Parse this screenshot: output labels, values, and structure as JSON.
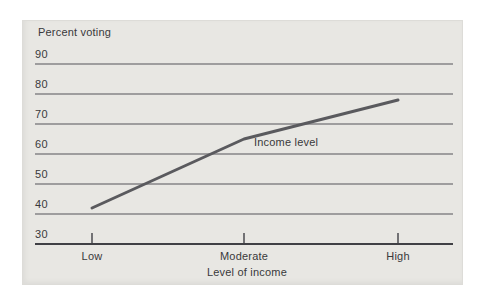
{
  "colors": {
    "panel_background": "#e8e7e3",
    "grid_line": "#55555a",
    "axis_line": "#404045",
    "data_line": "#5a5a5e",
    "text": "#39393b"
  },
  "chart_data": {
    "type": "line",
    "title": "",
    "ylabel": "Percent voting",
    "xlabel": "Level of income",
    "categories": [
      "Low",
      "Moderate",
      "High"
    ],
    "series": [
      {
        "name": "Income level",
        "values": [
          42,
          65,
          78
        ]
      }
    ],
    "ylim": [
      30,
      90
    ],
    "yticks": [
      90,
      80,
      70,
      60,
      50,
      40,
      30
    ],
    "grid": "horizontal gridlines only, y-tick labels sit above each line",
    "legend_position": "inline annotation beside the line"
  }
}
